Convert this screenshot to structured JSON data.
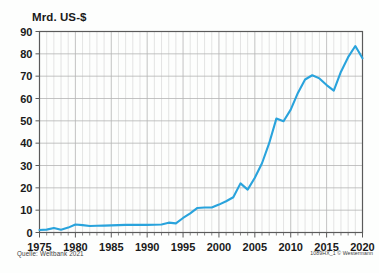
{
  "figure": {
    "axis_title": "Mrd. US-$",
    "source_note": "Quelle: Weltbank 2021",
    "credit_note": "1089HX_1 © Westermann",
    "line_color": "#29a3dc",
    "grid_color": "#d9d9d9",
    "grid_major_color": "#b4b4b4",
    "frame_color": "#5a5a5a",
    "background_color": "#fdfefd"
  },
  "chart_data": {
    "type": "line",
    "title": "",
    "subtitle": "",
    "xlabel": "",
    "ylabel": "Mrd. US-$",
    "xlim": [
      1975,
      2020
    ],
    "ylim": [
      0,
      90
    ],
    "ytick_step": 10,
    "yticks": [
      0,
      10,
      20,
      30,
      40,
      50,
      60,
      70,
      80,
      90
    ],
    "xticks": [
      1975,
      1980,
      1985,
      1990,
      1995,
      2000,
      2005,
      2010,
      2015,
      2020
    ],
    "x_minor_step": 1,
    "grid": true,
    "legend": false,
    "legend_position": "none",
    "series": [
      {
        "name": "Mrd. US-$",
        "color": "#29a3dc",
        "x": [
          1975,
          1976,
          1977,
          1978,
          1979,
          1980,
          1981,
          1982,
          1983,
          1984,
          1985,
          1986,
          1987,
          1988,
          1989,
          1990,
          1991,
          1992,
          1993,
          1994,
          1995,
          1996,
          1997,
          1998,
          1999,
          2000,
          2001,
          2002,
          2003,
          2004,
          2005,
          2006,
          2007,
          2008,
          2009,
          2010,
          2011,
          2012,
          2013,
          2014,
          2015,
          2016,
          2017,
          2018,
          2019,
          2020
        ],
        "values": [
          1.1,
          1.3,
          2.0,
          1.2,
          2.2,
          3.6,
          3.3,
          2.9,
          3.0,
          3.1,
          3.2,
          3.3,
          3.4,
          3.4,
          3.4,
          3.4,
          3.5,
          3.6,
          4.4,
          4.1,
          6.5,
          8.6,
          11.0,
          11.2,
          11.2,
          12.5,
          14.0,
          15.8,
          22.0,
          19.2,
          24.5,
          31.0,
          40.0,
          51.0,
          49.8,
          55.0,
          62.5,
          68.5,
          70.4,
          69.0,
          66.0,
          63.5,
          72.0,
          78.5,
          83.5,
          78.0
        ]
      }
    ]
  }
}
